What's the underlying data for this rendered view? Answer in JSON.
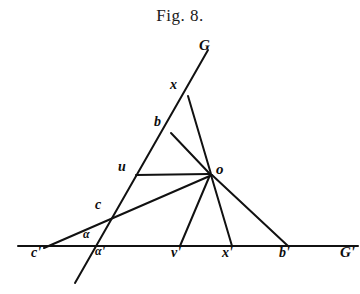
{
  "figure": {
    "title": "Fig. 8.",
    "background_color": "#ffffff",
    "ink_color": "#111111",
    "width": 360,
    "height": 294
  },
  "points": [
    {
      "id": "G",
      "label": "G",
      "x": 206,
      "y": 52,
      "label_x": 199,
      "label_y": 38,
      "size": "lg"
    },
    {
      "id": "x",
      "label": "x",
      "x": 188,
      "y": 96,
      "label_x": 170,
      "label_y": 78,
      "size": "md"
    },
    {
      "id": "b",
      "label": "b",
      "x": 171,
      "y": 133,
      "label_x": 154,
      "label_y": 115,
      "size": "md"
    },
    {
      "id": "u",
      "label": "u",
      "x": 136,
      "y": 175,
      "label_x": 118,
      "label_y": 160,
      "size": "md"
    },
    {
      "id": "o",
      "label": "o",
      "x": 210,
      "y": 174,
      "label_x": 216,
      "label_y": 162,
      "size": "lg"
    },
    {
      "id": "c",
      "label": "c",
      "x": 110,
      "y": 212,
      "label_x": 95,
      "label_y": 198,
      "size": "md"
    },
    {
      "id": "alpha",
      "label": "α",
      "x": 92,
      "y": 236,
      "label_x": 83,
      "label_y": 228,
      "size": "sm"
    },
    {
      "id": "cprime",
      "label": "c'",
      "x": 48,
      "y": 246,
      "label_x": 31,
      "label_y": 246,
      "size": "md"
    },
    {
      "id": "aprime",
      "label": "α'",
      "x": 101,
      "y": 246,
      "label_x": 95,
      "label_y": 245,
      "size": "sm"
    },
    {
      "id": "vprime",
      "label": "v'",
      "x": 180,
      "y": 246,
      "label_x": 171,
      "label_y": 246,
      "size": "md"
    },
    {
      "id": "xprime",
      "label": "x'",
      "x": 232,
      "y": 246,
      "label_x": 222,
      "label_y": 246,
      "size": "md"
    },
    {
      "id": "bprime",
      "label": "b'",
      "x": 288,
      "y": 246,
      "label_x": 279,
      "label_y": 246,
      "size": "md"
    },
    {
      "id": "Gprime",
      "label": "G'",
      "x": 356,
      "y": 246,
      "label_x": 340,
      "label_y": 245,
      "size": "lg"
    }
  ],
  "lines": [
    {
      "name": "baseline-GG",
      "x1": 18,
      "y1": 246,
      "x2": 358,
      "y2": 246,
      "width": 2.0
    },
    {
      "name": "transversal-G-line",
      "x1": 208,
      "y1": 50,
      "x2": 75,
      "y2": 283,
      "width": 2.0
    },
    {
      "name": "ray-cprime-to-o",
      "x1": 44,
      "y1": 248,
      "x2": 212,
      "y2": 175,
      "width": 2.0
    },
    {
      "name": "segment-x-to-o",
      "x1": 188,
      "y1": 96,
      "x2": 211,
      "y2": 174,
      "width": 2.0
    },
    {
      "name": "segment-b-to-o",
      "x1": 171,
      "y1": 133,
      "x2": 210,
      "y2": 174,
      "width": 2.0
    },
    {
      "name": "segment-u-to-o",
      "x1": 136,
      "y1": 175,
      "x2": 209,
      "y2": 174,
      "width": 2.0
    },
    {
      "name": "segment-o-to-vprime",
      "x1": 210,
      "y1": 175,
      "x2": 180,
      "y2": 246,
      "width": 2.0
    },
    {
      "name": "segment-o-to-xprime",
      "x1": 211,
      "y1": 175,
      "x2": 232,
      "y2": 246,
      "width": 2.0
    },
    {
      "name": "segment-o-to-bprime",
      "x1": 212,
      "y1": 175,
      "x2": 288,
      "y2": 246,
      "width": 2.0
    }
  ]
}
